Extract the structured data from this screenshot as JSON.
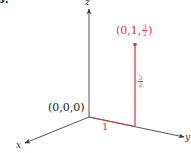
{
  "figure": {
    "part_label": "b.",
    "axes": {
      "x_label": "x",
      "y_label": "y",
      "z_label": "z",
      "axis_color": "#333333"
    },
    "origin": {
      "label": "(0,0,0)"
    },
    "point": {
      "label_prefix": "(0,1,",
      "label_frac_num": "3",
      "label_frac_den": "2",
      "label_suffix": ")",
      "coordinates": [
        0,
        1,
        1.5
      ]
    },
    "segments": {
      "y_length_label": "1",
      "z_height_num": "3",
      "z_height_den": "2"
    },
    "accent_color": "#d9333f"
  }
}
